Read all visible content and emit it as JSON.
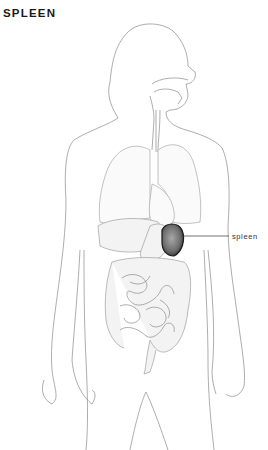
{
  "title": "SPLEEN",
  "labels": [
    {
      "text": "spleen",
      "target": "spleen-organ"
    }
  ],
  "colors": {
    "outline": "#8a8a8a",
    "spleen_fill": "#5a5a5a",
    "spleen_stroke": "#1a1a1a",
    "background": "#ffffff",
    "text": "#1a1a1a"
  }
}
